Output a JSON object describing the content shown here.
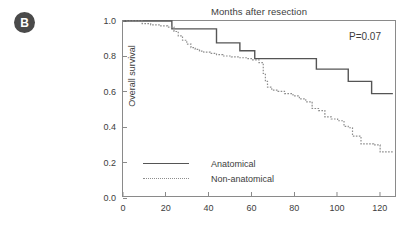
{
  "panel": {
    "label": "B"
  },
  "pvalue": {
    "text": "P=0.07"
  },
  "legend": {
    "items": [
      {
        "label": "Anatomical",
        "style": "solid",
        "color": "#555555"
      },
      {
        "label": "Non-anatomical",
        "style": "dotted",
        "color": "#8d8d8d"
      }
    ]
  },
  "chart_data": {
    "type": "line",
    "title": "Months after resection",
    "xlabel": "Months after resection",
    "ylabel": "Overall survival",
    "xlim": [
      0,
      128
    ],
    "ylim": [
      0.0,
      1.0
    ],
    "xticks": [
      0,
      20,
      40,
      60,
      80,
      100,
      120
    ],
    "xticklabels": [
      "0",
      "20",
      "40",
      "60",
      "80",
      "100",
      "120"
    ],
    "yticks": [
      0.0,
      0.2,
      0.4,
      0.6,
      0.8,
      1.0
    ],
    "yticklabels": [
      "0.0",
      "0.2",
      "0.4",
      "0.6",
      "0.8",
      "1.0"
    ],
    "grid": false,
    "legend_position": "lower-left",
    "annotations": [
      {
        "text": "P=0.07",
        "x": 108,
        "y": 0.93
      }
    ],
    "series": [
      {
        "name": "Anatomical",
        "style": "solid",
        "color": "#555555",
        "x": [
          0,
          23,
          23,
          44,
          44,
          55,
          55,
          62,
          62,
          91,
          91,
          106,
          106,
          117,
          117,
          127
        ],
        "y": [
          1.0,
          1.0,
          0.955,
          0.955,
          0.875,
          0.875,
          0.83,
          0.83,
          0.785,
          0.785,
          0.725,
          0.725,
          0.655,
          0.655,
          0.585,
          0.585
        ]
      },
      {
        "name": "Non-anatomical",
        "style": "dotted",
        "color": "#8d8d8d",
        "x": [
          0,
          9,
          9,
          13,
          13,
          17,
          17,
          21,
          21,
          24,
          24,
          26,
          26,
          28,
          28,
          30,
          30,
          32,
          32,
          34,
          34,
          36,
          36,
          38,
          38,
          41,
          41,
          44,
          44,
          47,
          47,
          51,
          51,
          55,
          55,
          58,
          58,
          61,
          61,
          64,
          64,
          66,
          66,
          67,
          67,
          68,
          68,
          70,
          70,
          73,
          73,
          76,
          76,
          80,
          80,
          83,
          83,
          86,
          86,
          89,
          89,
          92,
          92,
          95,
          95,
          98,
          98,
          101,
          101,
          104,
          104,
          106,
          106,
          108,
          108,
          112,
          112,
          118,
          118,
          121,
          121,
          127
        ],
        "y": [
          1.0,
          1.0,
          0.985,
          0.985,
          0.978,
          0.978,
          0.972,
          0.972,
          0.965,
          0.965,
          0.94,
          0.94,
          0.915,
          0.915,
          0.89,
          0.89,
          0.868,
          0.868,
          0.848,
          0.848,
          0.838,
          0.838,
          0.828,
          0.828,
          0.822,
          0.822,
          0.815,
          0.815,
          0.808,
          0.808,
          0.8,
          0.8,
          0.795,
          0.795,
          0.79,
          0.79,
          0.785,
          0.785,
          0.778,
          0.778,
          0.762,
          0.762,
          0.7,
          0.7,
          0.655,
          0.655,
          0.622,
          0.622,
          0.605,
          0.605,
          0.598,
          0.598,
          0.585,
          0.585,
          0.572,
          0.572,
          0.555,
          0.555,
          0.538,
          0.538,
          0.5,
          0.5,
          0.488,
          0.488,
          0.452,
          0.452,
          0.44,
          0.44,
          0.43,
          0.43,
          0.398,
          0.398,
          0.39,
          0.39,
          0.342,
          0.342,
          0.298,
          0.298,
          0.292,
          0.292,
          0.252,
          0.252
        ]
      }
    ]
  }
}
